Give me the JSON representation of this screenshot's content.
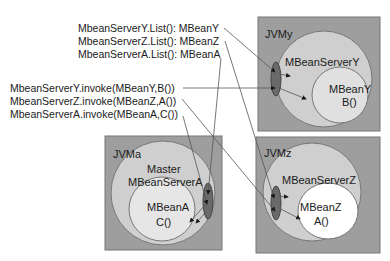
{
  "list_calls": [
    "MbeanServerY.List(): MBeanY",
    "MbeanServerZ.List(): MBeanZ",
    "MbeanServerA.List(): MBeanA"
  ],
  "invoke_calls": [
    "MbeanServerY.invoke(MBeanY,B())",
    "MbeanServerZ.invoke(MBeanZ,A())",
    "MbeanServerA.invoke(MBeanA,C())"
  ],
  "jvms": {
    "y": {
      "label": "JVMy",
      "server": "MBeanServerY",
      "mbean": "MBeanY",
      "method": "B()"
    },
    "a": {
      "label": "JVMa",
      "server_line1": "Master",
      "server_line2": "MBeanServerA",
      "mbean": "MBeanA",
      "method": "C()"
    },
    "z": {
      "label": "JVMz",
      "server": "MBeanServerZ",
      "mbean": "MBeanZ",
      "method": "A()"
    }
  },
  "colors": {
    "jvm_box": "#9e9e9e",
    "server_circle": "#cfcfcf",
    "mbean_circle_y": "#e0e0e0",
    "mbean_circle_a": "#e6e6e6",
    "mbean_circle_z": "#ffffff",
    "connector": "#555555"
  }
}
